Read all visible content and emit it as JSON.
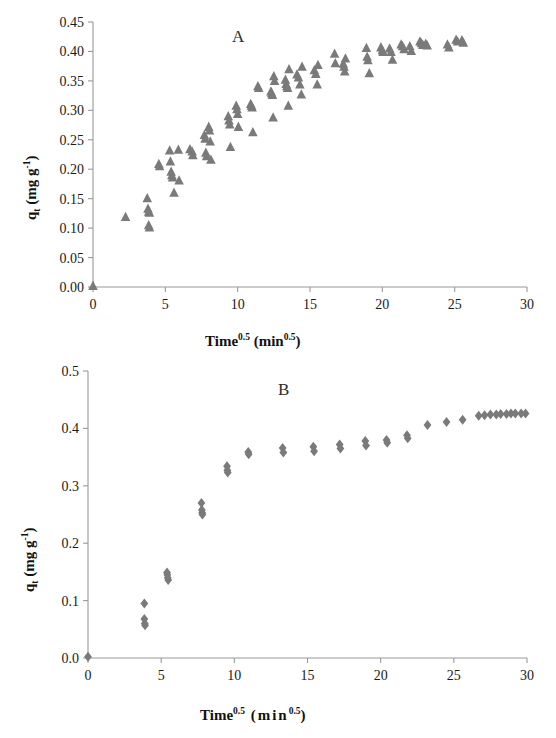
{
  "figure": {
    "background": "#ffffff",
    "marker_color": "#7a7a7a",
    "axis_color": "#999999"
  },
  "chart_data": [
    {
      "type": "scatter",
      "panel_label": "A",
      "title": "",
      "xlabel": "Time0.5 (min0.5)",
      "ylabel": "qt (mg g-1)",
      "xlim": [
        0,
        30
      ],
      "ylim": [
        0,
        0.45
      ],
      "xticks": [
        0,
        5,
        10,
        15,
        20,
        25,
        30
      ],
      "xtick_labels": [
        "0",
        "5",
        "10",
        "15",
        "20",
        "25",
        "30"
      ],
      "yticks": [
        0,
        0.05,
        0.1,
        0.15,
        0.2,
        0.25,
        0.3,
        0.35,
        0.4,
        0.45
      ],
      "ytick_labels": [
        "0.00",
        "0.05",
        "0.10",
        "0.15",
        "0.20",
        "0.25",
        "0.30",
        "0.35",
        "0.40",
        "0.45"
      ],
      "grid": false,
      "legend": false,
      "marker": "triangle",
      "marker_color": "#7a7a7a",
      "series": [
        {
          "name": "qt vs Time^0.5",
          "points": [
            [
              0.0,
              0.002
            ],
            [
              2.25,
              0.119
            ],
            [
              3.75,
              0.151
            ],
            [
              3.8,
              0.133
            ],
            [
              3.85,
              0.128
            ],
            [
              3.9,
              0.126
            ],
            [
              3.85,
              0.105
            ],
            [
              3.9,
              0.101
            ],
            [
              4.55,
              0.209
            ],
            [
              4.6,
              0.205
            ],
            [
              5.3,
              0.232
            ],
            [
              5.35,
              0.213
            ],
            [
              5.4,
              0.196
            ],
            [
              5.45,
              0.19
            ],
            [
              5.5,
              0.186
            ],
            [
              5.6,
              0.16
            ],
            [
              5.9,
              0.233
            ],
            [
              5.95,
              0.181
            ],
            [
              6.7,
              0.234
            ],
            [
              6.85,
              0.23
            ],
            [
              6.9,
              0.224
            ],
            [
              7.7,
              0.258
            ],
            [
              7.75,
              0.252
            ],
            [
              7.8,
              0.228
            ],
            [
              7.85,
              0.222
            ],
            [
              8.0,
              0.272
            ],
            [
              8.05,
              0.266
            ],
            [
              8.1,
              0.247
            ],
            [
              8.15,
              0.216
            ],
            [
              9.35,
              0.29
            ],
            [
              9.4,
              0.283
            ],
            [
              9.45,
              0.276
            ],
            [
              9.5,
              0.238
            ],
            [
              9.9,
              0.308
            ],
            [
              9.95,
              0.302
            ],
            [
              10.0,
              0.294
            ],
            [
              10.05,
              0.272
            ],
            [
              10.9,
              0.311
            ],
            [
              10.95,
              0.308
            ],
            [
              11.0,
              0.305
            ],
            [
              11.05,
              0.263
            ],
            [
              11.4,
              0.341
            ],
            [
              11.45,
              0.338
            ],
            [
              12.3,
              0.332
            ],
            [
              12.35,
              0.329
            ],
            [
              12.4,
              0.326
            ],
            [
              12.45,
              0.288
            ],
            [
              12.5,
              0.358
            ],
            [
              12.55,
              0.35
            ],
            [
              13.3,
              0.352
            ],
            [
              13.35,
              0.345
            ],
            [
              13.4,
              0.341
            ],
            [
              13.45,
              0.338
            ],
            [
              13.5,
              0.308
            ],
            [
              13.55,
              0.37
            ],
            [
              14.1,
              0.361
            ],
            [
              14.2,
              0.356
            ],
            [
              14.3,
              0.344
            ],
            [
              14.4,
              0.327
            ],
            [
              14.45,
              0.374
            ],
            [
              15.3,
              0.368
            ],
            [
              15.4,
              0.362
            ],
            [
              15.5,
              0.344
            ],
            [
              15.55,
              0.377
            ],
            [
              16.7,
              0.396
            ],
            [
              16.75,
              0.38
            ],
            [
              17.3,
              0.379
            ],
            [
              17.35,
              0.374
            ],
            [
              17.4,
              0.366
            ],
            [
              17.45,
              0.388
            ],
            [
              18.9,
              0.406
            ],
            [
              18.95,
              0.391
            ],
            [
              19.0,
              0.385
            ],
            [
              19.1,
              0.363
            ],
            [
              19.9,
              0.407
            ],
            [
              20.0,
              0.402
            ],
            [
              20.05,
              0.399
            ],
            [
              20.5,
              0.405
            ],
            [
              20.6,
              0.399
            ],
            [
              20.7,
              0.386
            ],
            [
              21.3,
              0.412
            ],
            [
              21.4,
              0.409
            ],
            [
              21.5,
              0.404
            ],
            [
              21.9,
              0.409
            ],
            [
              22.0,
              0.401
            ],
            [
              22.6,
              0.417
            ],
            [
              22.7,
              0.414
            ],
            [
              22.8,
              0.411
            ],
            [
              23.0,
              0.413
            ],
            [
              23.1,
              0.41
            ],
            [
              24.5,
              0.412
            ],
            [
              24.6,
              0.407
            ],
            [
              25.1,
              0.42
            ],
            [
              25.2,
              0.417
            ],
            [
              25.5,
              0.419
            ],
            [
              25.6,
              0.415
            ]
          ]
        }
      ]
    },
    {
      "type": "scatter",
      "panel_label": "B",
      "title": "",
      "xlabel": "Time0.5  (min0.5)",
      "ylabel": "qt (mg g-1)",
      "xlim": [
        0,
        30
      ],
      "ylim": [
        0,
        0.5
      ],
      "xticks": [
        0,
        5,
        10,
        15,
        20,
        25,
        30
      ],
      "xtick_labels": [
        "0",
        "5",
        "10",
        "15",
        "20",
        "25",
        "30"
      ],
      "yticks": [
        0,
        0.1,
        0.2,
        0.3,
        0.4,
        0.5
      ],
      "ytick_labels": [
        "0.0",
        "0.1",
        "0.2",
        "0.3",
        "0.4",
        "0.5"
      ],
      "grid": false,
      "legend": false,
      "marker": "diamond",
      "marker_color": "#7a7a7a",
      "series": [
        {
          "name": "qt vs Time^0.5",
          "points": [
            [
              0.0,
              0.002
            ],
            [
              3.85,
              0.095
            ],
            [
              3.85,
              0.068
            ],
            [
              3.88,
              0.06
            ],
            [
              3.9,
              0.057
            ],
            [
              5.4,
              0.149
            ],
            [
              5.42,
              0.145
            ],
            [
              5.45,
              0.14
            ],
            [
              5.48,
              0.136
            ],
            [
              7.75,
              0.27
            ],
            [
              7.78,
              0.258
            ],
            [
              7.8,
              0.253
            ],
            [
              7.82,
              0.25
            ],
            [
              9.5,
              0.334
            ],
            [
              9.52,
              0.327
            ],
            [
              9.55,
              0.323
            ],
            [
              10.95,
              0.359
            ],
            [
              10.98,
              0.355
            ],
            [
              13.3,
              0.366
            ],
            [
              13.35,
              0.358
            ],
            [
              15.4,
              0.368
            ],
            [
              15.45,
              0.36
            ],
            [
              17.2,
              0.372
            ],
            [
              17.25,
              0.365
            ],
            [
              18.95,
              0.378
            ],
            [
              19.0,
              0.37
            ],
            [
              20.4,
              0.38
            ],
            [
              20.45,
              0.375
            ],
            [
              21.8,
              0.388
            ],
            [
              21.85,
              0.383
            ],
            [
              23.2,
              0.406
            ],
            [
              24.5,
              0.411
            ],
            [
              25.6,
              0.415
            ],
            [
              26.7,
              0.422
            ],
            [
              27.1,
              0.423
            ],
            [
              27.5,
              0.424
            ],
            [
              27.9,
              0.424
            ],
            [
              28.2,
              0.425
            ],
            [
              28.6,
              0.425
            ],
            [
              28.9,
              0.426
            ],
            [
              29.2,
              0.426
            ],
            [
              29.6,
              0.426
            ],
            [
              29.9,
              0.426
            ]
          ]
        }
      ]
    }
  ],
  "panel_a": {
    "letter": "A",
    "xlabel_main": "Time",
    "xlabel_exp": "0.5",
    "xlabel_unit_open": " (min",
    "xlabel_unit_exp": "0.5",
    "xlabel_unit_close": ")",
    "ylabel_q": "q",
    "ylabel_sub": "t",
    "ylabel_rest": " (mg g",
    "ylabel_exp": "-1",
    "ylabel_close": ")"
  },
  "panel_b": {
    "letter": "B",
    "xlabel_main": "Time",
    "xlabel_exp": "0.5",
    "xlabel_unit_open": "  (min",
    "xlabel_unit_exp": "0.5",
    "xlabel_unit_close": ")",
    "ylabel_q": "q",
    "ylabel_sub": "t",
    "ylabel_rest": " (mg g",
    "ylabel_exp": "-1",
    "ylabel_close": ")"
  }
}
